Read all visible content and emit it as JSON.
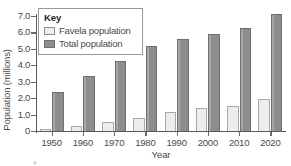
{
  "chart_data": {
    "type": "bar",
    "title": "",
    "xlabel": "Year",
    "ylabel": "Population (millions)",
    "categories": [
      "1950",
      "1960",
      "1970",
      "1980",
      "1990",
      "2000",
      "2010",
      "2020"
    ],
    "series": [
      {
        "name": "Favela population",
        "color": "#eeedec",
        "values": [
          0.15,
          0.3,
          0.55,
          0.8,
          1.15,
          1.4,
          1.5,
          1.95
        ]
      },
      {
        "name": "Total population",
        "color": "#8d8d8d",
        "values": [
          2.35,
          3.35,
          4.25,
          5.15,
          5.6,
          5.9,
          6.3,
          7.15
        ]
      }
    ],
    "ylim": [
      0,
      7.0
    ],
    "y_ticks": [
      0,
      1.0,
      2.0,
      3.0,
      4.0,
      5.0,
      6.0,
      7.0
    ],
    "y_tick_labels": [
      "0",
      "1.0",
      "2.0",
      "3.0",
      "4.0",
      "5.0",
      "6.0",
      "7.0"
    ],
    "grid": false,
    "legend_position": "top-left"
  },
  "legend": {
    "title": "Key",
    "entries": [
      {
        "label": "Favela population",
        "swatch": "favela"
      },
      {
        "label": "Total population",
        "swatch": "total"
      }
    ]
  }
}
